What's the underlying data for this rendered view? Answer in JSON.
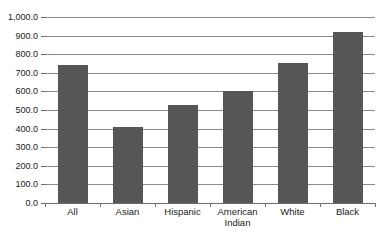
{
  "chart_data": {
    "type": "bar",
    "title": "",
    "xlabel": "",
    "ylabel": "",
    "categories": [
      "All",
      "Asian",
      "Hispanic",
      "American Indian",
      "White",
      "Black"
    ],
    "category_lines": [
      [
        "All"
      ],
      [
        "Asian"
      ],
      [
        "Hispanic"
      ],
      [
        "American",
        "Indian"
      ],
      [
        "White"
      ],
      [
        "Black"
      ]
    ],
    "values": [
      740,
      410,
      525,
      600,
      750,
      920
    ],
    "ylim": [
      0,
      1000
    ],
    "ytick_step": 100,
    "ytick_labels": [
      "1,000.0",
      "900.0",
      "800.0",
      "700.0",
      "600.0",
      "500.0",
      "400.0",
      "300.0",
      "200.0",
      "100.0",
      "0.0"
    ],
    "ytick_values": [
      1000,
      900,
      800,
      700,
      600,
      500,
      400,
      300,
      200,
      100,
      0
    ],
    "grid": true,
    "legend": false,
    "legend_position": "none",
    "bar_color": "#565656",
    "gridline_color": "#8a8a8a",
    "axis_color": "#6e6e6e",
    "background_color": "#ffffff"
  }
}
